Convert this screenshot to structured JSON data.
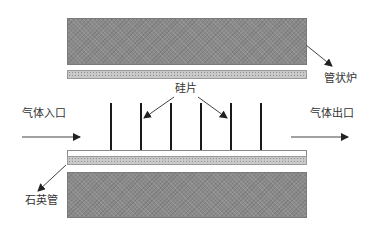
{
  "diagram": {
    "labels": {
      "furnace": "管状炉",
      "wafers": "硅片",
      "gas_inlet": "气体入口",
      "gas_outlet": "气体出口",
      "quartz_tube": "石英管"
    },
    "components": {
      "wafer_count": 6
    },
    "colors": {
      "furnace_fill": "#8a8a8a",
      "quartz_fill": "#c9c9c9",
      "wafer": "#1a1a1a",
      "arrow": "#333333"
    }
  }
}
